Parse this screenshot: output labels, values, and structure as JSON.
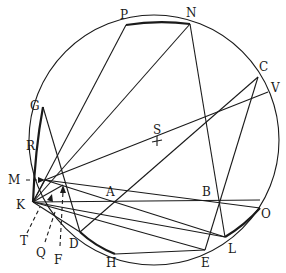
{
  "diagram": {
    "type": "geometric-construction",
    "circle": {
      "cx": 154,
      "cy": 140,
      "r": 125
    },
    "center_label": "S",
    "colors": {
      "stroke": "#1a1a1a",
      "background": "#ffffff"
    },
    "points": {
      "P": {
        "label": "P",
        "x": 126,
        "y": 25
      },
      "N": {
        "label": "N",
        "x": 190,
        "y": 24
      },
      "C": {
        "label": "C",
        "x": 258,
        "y": 77
      },
      "V": {
        "label": "V",
        "x": 268,
        "y": 92
      },
      "G": {
        "label": "G",
        "x": 43,
        "y": 107
      },
      "R": {
        "label": "R",
        "x": 38,
        "y": 145
      },
      "M": {
        "label": "M",
        "x": 45,
        "y": 180
      },
      "K": {
        "label": "K",
        "x": 33,
        "y": 202
      },
      "A": {
        "label": "A",
        "x": 115,
        "y": 200
      },
      "B": {
        "label": "B",
        "x": 219,
        "y": 198
      },
      "S": {
        "label": "S",
        "x": 157,
        "y": 141
      },
      "O": {
        "label": "O",
        "x": 260,
        "y": 208
      },
      "L": {
        "label": "L",
        "x": 225,
        "y": 237
      },
      "E": {
        "label": "E",
        "x": 205,
        "y": 250
      },
      "H": {
        "label": "H",
        "x": 115,
        "y": 254
      },
      "D": {
        "label": "D",
        "x": 80,
        "y": 232
      },
      "T": {
        "label": "T",
        "x": 25,
        "y": 244
      },
      "Q": {
        "label": "Q",
        "x": 40,
        "y": 253
      },
      "F": {
        "label": "F",
        "x": 59,
        "y": 258
      }
    },
    "labels": {
      "P": "P",
      "N": "N",
      "C": "C",
      "V": "V",
      "G": "G",
      "R": "R",
      "M": "M",
      "K": "K",
      "A": "A",
      "B": "B",
      "S": "S",
      "O": "O",
      "L": "L",
      "E": "E",
      "H": "H",
      "D": "D",
      "T": "T",
      "Q": "Q",
      "F": "F"
    }
  }
}
